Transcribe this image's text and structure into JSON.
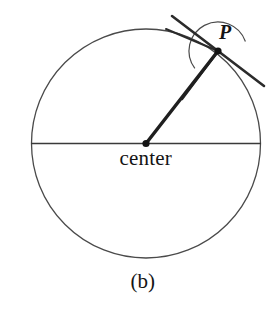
{
  "figure": {
    "caption": "(b)",
    "background_color": "#ffffff",
    "stroke_color": "#3a3a3a",
    "bold_stroke_color": "#1a1a1a",
    "width": 277,
    "height": 310,
    "labels": {
      "point_label": "P",
      "center_label": "center"
    },
    "elements": {
      "circle_name": "main-circle",
      "diameter_name": "horizontal-diameter",
      "radius_name": "radius-to-P",
      "tangent_name": "tangent-line-at-P",
      "angle_arc_name": "angle-arc-at-P",
      "center_dot_name": "center-point-dot",
      "point_dot_name": "point-P-dot"
    }
  },
  "chart_data": {
    "type": "diagram",
    "title": "(b)",
    "subtitle": "",
    "xlabel": "",
    "ylabel": "",
    "geometry": {
      "circle": {
        "cx": 146,
        "cy": 143.5,
        "r": 114.5,
        "stroke_width": 1.3
      },
      "diameter_line": {
        "x1": 31,
        "y1": 143.5,
        "x2": 261,
        "y2": 143.5,
        "stroke_width": 1.6
      },
      "point_P": {
        "x": 218,
        "y": 51,
        "angle_deg": 52,
        "dot_radius": 3.6
      },
      "center_point": {
        "x": 146,
        "y": 143.5,
        "dot_radius": 3.6
      },
      "radius_segment": {
        "x1": 146,
        "y1": 143.5,
        "x2": 218,
        "y2": 51,
        "stroke_width": 3.4
      },
      "tangent_segment": {
        "x1": 172,
        "y1": 16,
        "x2": 264,
        "y2": 86,
        "stroke_width": 2.6
      },
      "secondary_segment": {
        "x1": 166,
        "y1": 29,
        "x2": 218,
        "y2": 51,
        "stroke_width": 2.0
      },
      "lower_left_segment": {
        "x1": 218,
        "y1": 51,
        "x2": 182,
        "y2": 99,
        "stroke_width": 2.6
      },
      "angle_arc": {
        "cx": 218,
        "cy": 51,
        "r": 29,
        "start_deg": 143,
        "sweep_deg": 198,
        "stroke_width": 1.2
      }
    },
    "annotations": [
      {
        "text": "P",
        "x": 225,
        "y": 33,
        "style": "italic-serif"
      },
      {
        "text": "center",
        "x": 146,
        "y": 160,
        "style": "serif"
      },
      {
        "text": "(b)",
        "x": 143,
        "y": 285,
        "style": "serif"
      }
    ],
    "grid": false,
    "legend": "none"
  }
}
